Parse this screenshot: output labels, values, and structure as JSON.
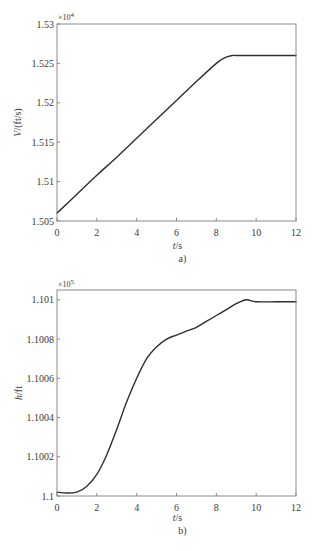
{
  "figure": {
    "panel_count": 2
  },
  "chart_data": [
    {
      "type": "line",
      "panel_label": "a)",
      "title": "",
      "xlabel": {
        "var": "t",
        "unit": "/s"
      },
      "ylabel": {
        "var": "V",
        "unit": "/(ft/s)"
      },
      "y_multiplier": {
        "base": "×10",
        "exponent": "4"
      },
      "xlim": [
        0,
        12
      ],
      "ylim": [
        1.505,
        1.53
      ],
      "xticks": [
        0,
        2,
        4,
        6,
        8,
        10,
        12
      ],
      "xtick_labels": [
        "0",
        "2",
        "4",
        "6",
        "8",
        "10",
        "12"
      ],
      "yticks": [
        1.505,
        1.51,
        1.515,
        1.52,
        1.525,
        1.53
      ],
      "ytick_labels": [
        "1.505",
        "1.51",
        "1.515",
        "1.52",
        "1.525",
        "1.53"
      ],
      "grid": false,
      "legend": null,
      "series": [
        {
          "name": "V",
          "color": "#2e2e2e",
          "x": [
            0,
            1,
            2,
            3,
            4,
            5,
            6,
            7,
            8,
            8.4,
            8.8,
            9,
            10,
            11,
            12
          ],
          "y": [
            1.506,
            1.5084,
            1.5108,
            1.5131,
            1.5155,
            1.5179,
            1.5203,
            1.5227,
            1.525,
            1.5257,
            1.526,
            1.526,
            1.526,
            1.526,
            1.526
          ]
        }
      ]
    },
    {
      "type": "line",
      "panel_label": "b)",
      "title": "",
      "xlabel": {
        "var": "t",
        "unit": "/s"
      },
      "ylabel": {
        "var": "h",
        "unit": "/ft"
      },
      "y_multiplier": {
        "base": "×10",
        "exponent": "5"
      },
      "xlim": [
        0,
        12
      ],
      "ylim": [
        1.1,
        1.10105
      ],
      "xticks": [
        0,
        2,
        4,
        6,
        8,
        10,
        12
      ],
      "xtick_labels": [
        "0",
        "2",
        "4",
        "6",
        "8",
        "10",
        "12"
      ],
      "yticks": [
        1.1,
        1.1002,
        1.1004,
        1.1006,
        1.1008,
        1.101
      ],
      "ytick_labels": [
        "1.1",
        "1.1002",
        "1.1004",
        "1.1006",
        "1.1008",
        "1.101"
      ],
      "grid": false,
      "legend": null,
      "series": [
        {
          "name": "h",
          "color": "#2e2e2e",
          "x": [
            0,
            0.5,
            1,
            1.5,
            2,
            2.5,
            3,
            3.5,
            4,
            4.5,
            5,
            5.5,
            6,
            6.5,
            7,
            7.5,
            8,
            8.5,
            9,
            9.5,
            10,
            11,
            12
          ],
          "y": [
            1.10002,
            1.100015,
            1.10002,
            1.10005,
            1.10011,
            1.10021,
            1.10034,
            1.10048,
            1.1006,
            1.1007,
            1.10076,
            1.1008,
            1.10082,
            1.10084,
            1.10086,
            1.10089,
            1.10092,
            1.10095,
            1.10098,
            1.101,
            1.10099,
            1.10099,
            1.10099
          ]
        }
      ]
    }
  ]
}
